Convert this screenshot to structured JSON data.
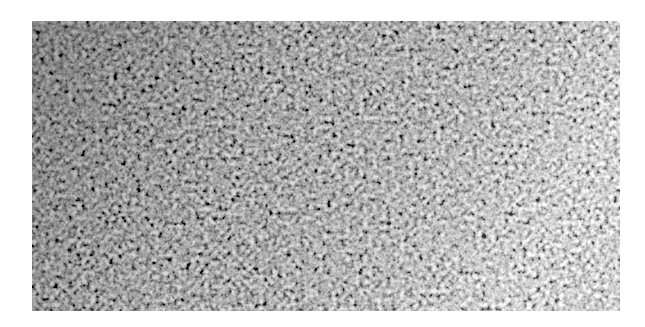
{
  "image": {
    "description": "Grayscale speckle / granular noise texture photograph",
    "region": {
      "x": 32,
      "y": 21,
      "width": 588,
      "height": 290
    },
    "background": "#ffffff",
    "tones": {
      "dark": "#2a2a2a",
      "mid": "#8a8a8a",
      "light": "#e6e6e6"
    },
    "gradient": "darker on left, lighter toward right edge"
  }
}
